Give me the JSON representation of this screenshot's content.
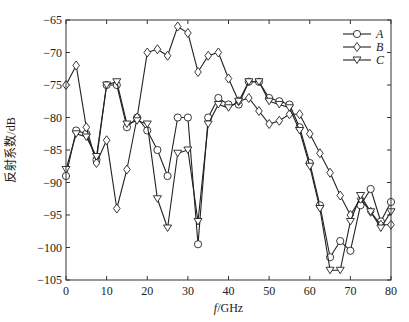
{
  "chart_data": {
    "type": "line",
    "title": "",
    "xlabel": "f/GHz",
    "ylabel": "反射系数/dB",
    "xlim": [
      0,
      80
    ],
    "ylim": [
      -105,
      -65
    ],
    "xticks": [
      0,
      10,
      20,
      30,
      40,
      50,
      60,
      70,
      80
    ],
    "yticks": [
      -65,
      -70,
      -75,
      -80,
      -85,
      -90,
      -95,
      -100,
      -105
    ],
    "grid": false,
    "legend_position": "upper right",
    "x": [
      0,
      2.5,
      5,
      7.5,
      10,
      12.5,
      15,
      17.5,
      20,
      22.5,
      25,
      27.5,
      30,
      32.5,
      35,
      37.5,
      40,
      42.5,
      45,
      47.5,
      50,
      52.5,
      55,
      57.5,
      60,
      62.5,
      65,
      67.5,
      70,
      72.5,
      75,
      77.5,
      80
    ],
    "series": [
      {
        "name": "A",
        "marker": "circle",
        "values": [
          -89,
          -82,
          -82.5,
          -86.5,
          -75,
          -75,
          -81.5,
          -80,
          -82,
          -85,
          -89,
          -80,
          -80,
          -99.5,
          -80,
          -77,
          -78,
          -78,
          -74.5,
          -74.5,
          -77,
          -77.5,
          -78,
          -81.5,
          -87,
          -93.5,
          -101.5,
          -99,
          -100.5,
          -93.5,
          -91,
          -96,
          -93
        ]
      },
      {
        "name": "B",
        "marker": "diamond",
        "values": [
          -75,
          -72,
          -81.5,
          -87,
          -83.5,
          -94,
          -88,
          -80,
          -70,
          -69.5,
          -70.5,
          -66,
          -67,
          -73,
          -70.5,
          -70,
          -74,
          -77.5,
          -77,
          -79,
          -81,
          -80.5,
          -79.5,
          -79.5,
          -82.5,
          -85.5,
          -88.5,
          -92,
          -95,
          -92.5,
          -94.5,
          -96.5,
          -96.5
        ]
      },
      {
        "name": "C",
        "marker": "triangle-down",
        "values": [
          -88,
          -82.5,
          -83,
          -86,
          -75,
          -74.5,
          -81,
          -80.5,
          -81,
          -92.5,
          -97,
          -85.5,
          -85,
          -96,
          -81,
          -78,
          -78.5,
          -77.5,
          -74.5,
          -74.5,
          -77.5,
          -78,
          -78.5,
          -82,
          -87.5,
          -94,
          -103.5,
          -103.5,
          -96,
          -92,
          -94.5,
          -97,
          -94.5
        ]
      }
    ]
  }
}
